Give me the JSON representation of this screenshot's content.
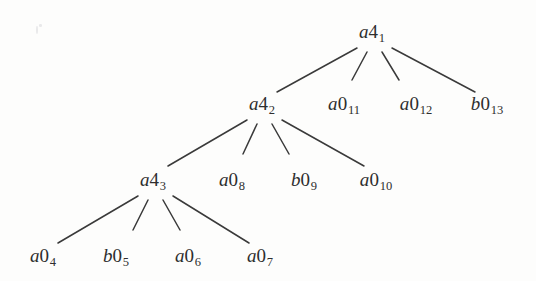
{
  "figure": {
    "type": "tree-diagram",
    "title": "",
    "background_color": "#fdfdfc",
    "edge_color": "#3a3a3a",
    "text_color": "#2e2e2e",
    "width": 536,
    "height": 281
  },
  "nodes": [
    {
      "id": "n1",
      "label": "a4_1",
      "base": "a",
      "digit": "4",
      "sub": "1",
      "x": 372,
      "y": 33,
      "level": 1,
      "kind": "internal"
    },
    {
      "id": "n2",
      "label": "a4_2",
      "base": "a",
      "digit": "4",
      "sub": "2",
      "x": 262,
      "y": 105,
      "level": 2,
      "kind": "internal"
    },
    {
      "id": "n11",
      "label": "a0_11",
      "base": "a",
      "digit": "0",
      "sub": "11",
      "x": 344,
      "y": 105,
      "level": 2,
      "kind": "leaf"
    },
    {
      "id": "n12",
      "label": "a0_12",
      "base": "a",
      "digit": "0",
      "sub": "12",
      "x": 416,
      "y": 105,
      "level": 2,
      "kind": "leaf"
    },
    {
      "id": "n13",
      "label": "b0_13",
      "base": "b",
      "digit": "0",
      "sub": "13",
      "x": 487,
      "y": 105,
      "level": 2,
      "kind": "leaf"
    },
    {
      "id": "n3",
      "label": "a4_3",
      "base": "a",
      "digit": "4",
      "sub": "3",
      "x": 153,
      "y": 181,
      "level": 3,
      "kind": "internal"
    },
    {
      "id": "n8",
      "label": "a0_8",
      "base": "a",
      "digit": "0",
      "sub": "8",
      "x": 232,
      "y": 181,
      "level": 3,
      "kind": "leaf"
    },
    {
      "id": "n9",
      "label": "b0_9",
      "base": "b",
      "digit": "0",
      "sub": "9",
      "x": 304,
      "y": 181,
      "level": 3,
      "kind": "leaf"
    },
    {
      "id": "n10",
      "label": "a0_10",
      "base": "a",
      "digit": "0",
      "sub": "10",
      "x": 376,
      "y": 181,
      "level": 3,
      "kind": "leaf"
    },
    {
      "id": "n4",
      "label": "a0_4",
      "base": "a",
      "digit": "0",
      "sub": "4",
      "x": 43,
      "y": 257,
      "level": 4,
      "kind": "leaf"
    },
    {
      "id": "n5",
      "label": "b0_5",
      "base": "b",
      "digit": "0",
      "sub": "5",
      "x": 116,
      "y": 257,
      "level": 4,
      "kind": "leaf"
    },
    {
      "id": "n6",
      "label": "a0_6",
      "base": "a",
      "digit": "0",
      "sub": "6",
      "x": 188,
      "y": 257,
      "level": 4,
      "kind": "leaf"
    },
    {
      "id": "n7",
      "label": "a0_7",
      "base": "a",
      "digit": "0",
      "sub": "7",
      "x": 260,
      "y": 257,
      "level": 4,
      "kind": "leaf"
    }
  ],
  "edges": [
    {
      "from": "n1",
      "to": "n2",
      "x1": 357,
      "y1": 48,
      "x2": 277,
      "y2": 92
    },
    {
      "from": "n1",
      "to": "n11",
      "x1": 367,
      "y1": 52,
      "x2": 352,
      "y2": 80
    },
    {
      "from": "n1",
      "to": "n12",
      "x1": 382,
      "y1": 52,
      "x2": 399,
      "y2": 80
    },
    {
      "from": "n1",
      "to": "n13",
      "x1": 392,
      "y1": 48,
      "x2": 475,
      "y2": 92
    },
    {
      "from": "n2",
      "to": "n3",
      "x1": 247,
      "y1": 120,
      "x2": 168,
      "y2": 166
    },
    {
      "from": "n2",
      "to": "n8",
      "x1": 257,
      "y1": 124,
      "x2": 243,
      "y2": 154
    },
    {
      "from": "n2",
      "to": "n9",
      "x1": 272,
      "y1": 124,
      "x2": 289,
      "y2": 154
    },
    {
      "from": "n2",
      "to": "n10",
      "x1": 282,
      "y1": 120,
      "x2": 364,
      "y2": 166
    },
    {
      "from": "n3",
      "to": "n4",
      "x1": 138,
      "y1": 196,
      "x2": 58,
      "y2": 243
    },
    {
      "from": "n3",
      "to": "n5",
      "x1": 148,
      "y1": 200,
      "x2": 133,
      "y2": 230
    },
    {
      "from": "n3",
      "to": "n6",
      "x1": 163,
      "y1": 200,
      "x2": 180,
      "y2": 230
    },
    {
      "from": "n3",
      "to": "n7",
      "x1": 173,
      "y1": 196,
      "x2": 249,
      "y2": 243
    }
  ],
  "specks": [
    {
      "x": 36,
      "y": 26,
      "w": 2,
      "h": 8
    },
    {
      "x": 39,
      "y": 24,
      "w": 3,
      "h": 3
    }
  ]
}
